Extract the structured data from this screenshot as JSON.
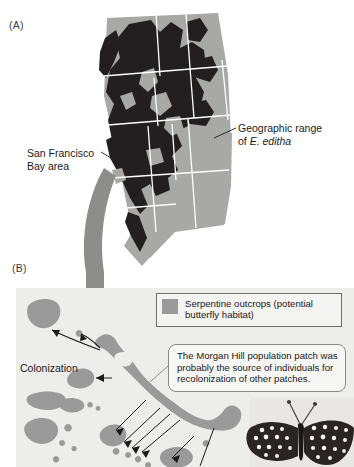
{
  "figure": {
    "panel_a": {
      "label": "(A)",
      "labels": {
        "geo_range_line1": "Geographic range",
        "geo_range_line2_prefix": "of ",
        "geo_range_species": "E. editha",
        "sf_bay_line1": "San Francisco",
        "sf_bay_line2": "Bay area"
      },
      "map": {
        "range_color": "#231f20",
        "land_color": "#a8a8a6",
        "border_color": "#ffffff",
        "arrow_color": "#8d8d8b"
      }
    },
    "panel_b": {
      "label": "(B)",
      "background_color": "#ededeb",
      "patch_color": "#9a9a9a",
      "legend": {
        "swatch_color": "#9a9a9a",
        "text_line1": "Serpentine outcrops (potential",
        "text_line2": "butterfly habitat)"
      },
      "callout": {
        "line1": "The Morgan Hill population patch was",
        "line2": "probably the source of individuals for",
        "line3": "recolonization of other patches."
      },
      "colonization_label": "Colonization"
    }
  }
}
